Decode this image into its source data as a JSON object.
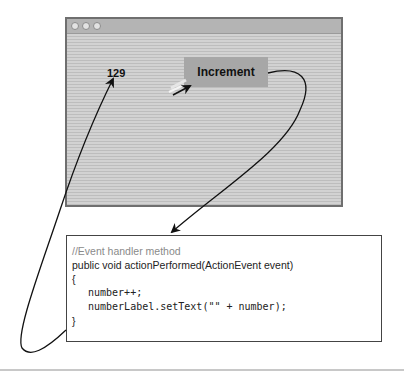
{
  "window": {
    "title_buttons": [
      "close",
      "minimize",
      "zoom"
    ],
    "number_label": "129",
    "button_label": "Increment"
  },
  "code": {
    "comment": "//Event handler method",
    "signature": "public void actionPerformed(ActionEvent event)",
    "open_brace": "{",
    "statements": [
      "number++;",
      "numberLabel.setText(\"\" + number);"
    ],
    "close_brace": "}"
  },
  "arrows": [
    {
      "from": "increment-button",
      "to": "event-handler-code",
      "meaning": "button click triggers handler"
    },
    {
      "from": "event-handler-code",
      "to": "number-label",
      "meaning": "handler updates label"
    }
  ],
  "colors": {
    "window_border": "#6f6f6f",
    "window_stripe_light": "#d2d2d2",
    "window_stripe_dark": "#bdbdbd",
    "button_bg": "#a7a7a7",
    "comment_text": "#8a8a8a",
    "arrow": "#111111"
  }
}
